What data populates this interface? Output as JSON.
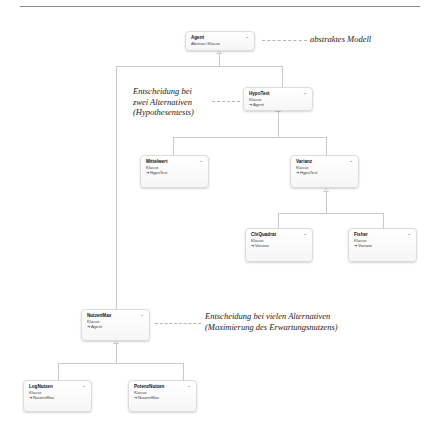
{
  "diagram": {
    "type": "class-hierarchy",
    "nodes": {
      "agent": {
        "name": "Agent",
        "kind": "Abstract Klasse",
        "parent": ""
      },
      "hypotest": {
        "name": "HypoTest",
        "kind": "Klasse",
        "parent": "Agent"
      },
      "mittelwert": {
        "name": "Mittelwert",
        "kind": "Klasse",
        "parent": "HypoTest"
      },
      "varianz": {
        "name": "Varianz",
        "kind": "Klasse",
        "parent": "HypoTest"
      },
      "chiquadrat": {
        "name": "ChiQuadrat",
        "kind": "Klasse",
        "parent": "Varianz"
      },
      "fisher": {
        "name": "Fisher",
        "kind": "Klasse",
        "parent": "Varianz"
      },
      "nutzenmax": {
        "name": "NutzenMax",
        "kind": "Klasse",
        "parent": "Agent"
      },
      "lognutzen": {
        "name": "LogNutzen",
        "kind": "Klasse",
        "parent": "NutzenMax"
      },
      "potenznutzen": {
        "name": "PotenzNutzen",
        "kind": "Klasse",
        "parent": "NutzenMax"
      }
    },
    "annotations": {
      "abstract_model": "abstraktes Modell",
      "two_alternatives": [
        "Entscheidung bei",
        "zwei Alternativen",
        "(Hypothesentests)"
      ],
      "many_alternatives": [
        "Entscheidung bei vielen Alternativen",
        "(Maximierung des Erwartungsnutzens)"
      ]
    },
    "icons": {
      "expand": "chevron-down-icon",
      "inherits": "arrow-right-icon"
    },
    "expand_glyph": "⌄",
    "colors": {
      "connector": "#c9c9c9",
      "node_border": "#dcdcdc",
      "rule": "#8a8a8a"
    }
  }
}
